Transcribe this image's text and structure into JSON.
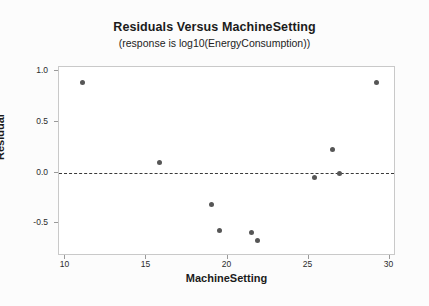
{
  "chart_data": {
    "type": "scatter",
    "title": "Residuals Versus MachineSetting",
    "subtitle": "(response is log10(EnergyConsumption))",
    "xlabel": "MachineSetting",
    "ylabel": "Residual",
    "xlim": [
      9.6,
      30.4
    ],
    "ylim": [
      -0.82,
      1.04
    ],
    "xticks": [
      10,
      15,
      20,
      25,
      30
    ],
    "xtick_labels": [
      "10",
      "15",
      "20",
      "25",
      "30"
    ],
    "yticks": [
      1.0,
      0.5,
      0.0,
      -0.5
    ],
    "ytick_labels": [
      "1.0",
      "0.5",
      "0.0",
      "-0.5"
    ],
    "grid": false,
    "legend": false,
    "reference_line": {
      "orientation": "horizontal",
      "value": 0.0,
      "style": "dashed",
      "color": "#3a3a3a"
    },
    "marker": {
      "shape": "circle",
      "color": "#565656",
      "size": 5
    },
    "x": [
      11.05,
      15.8,
      19.0,
      19.5,
      21.5,
      21.85,
      25.4,
      26.5,
      26.9,
      29.2
    ],
    "y": [
      0.885,
      0.1,
      -0.31,
      -0.57,
      -0.59,
      -0.67,
      -0.05,
      0.23,
      -0.01,
      0.89
    ],
    "points": [
      {
        "x": 11.05,
        "y": 0.885
      },
      {
        "x": 15.8,
        "y": 0.1
      },
      {
        "x": 19.0,
        "y": -0.31
      },
      {
        "x": 19.5,
        "y": -0.57
      },
      {
        "x": 21.5,
        "y": -0.59
      },
      {
        "x": 21.85,
        "y": -0.67
      },
      {
        "x": 25.4,
        "y": -0.05
      },
      {
        "x": 26.5,
        "y": 0.23
      },
      {
        "x": 26.9,
        "y": -0.01
      },
      {
        "x": 29.2,
        "y": 0.89
      }
    ]
  }
}
